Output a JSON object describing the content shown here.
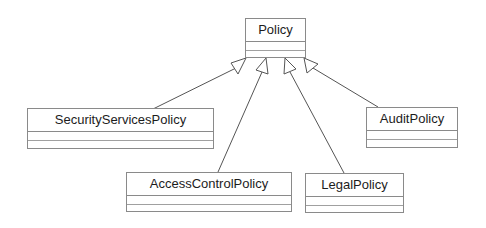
{
  "diagram": {
    "type": "uml-class-inheritance",
    "colors": {
      "line": "#555555",
      "border": "#8a8a8a",
      "text": "#1c1c1c",
      "background": "#ffffff"
    },
    "classes": [
      {
        "id": "policy",
        "name": "Policy"
      },
      {
        "id": "security",
        "name": "SecurityServicesPolicy"
      },
      {
        "id": "access",
        "name": "AccessControlPolicy"
      },
      {
        "id": "legal",
        "name": "LegalPolicy"
      },
      {
        "id": "audit",
        "name": "AuditPolicy"
      }
    ],
    "relations": [
      {
        "from": "SecurityServicesPolicy",
        "to": "Policy",
        "kind": "generalization"
      },
      {
        "from": "AccessControlPolicy",
        "to": "Policy",
        "kind": "generalization"
      },
      {
        "from": "LegalPolicy",
        "to": "Policy",
        "kind": "generalization"
      },
      {
        "from": "AuditPolicy",
        "to": "Policy",
        "kind": "generalization"
      }
    ]
  }
}
